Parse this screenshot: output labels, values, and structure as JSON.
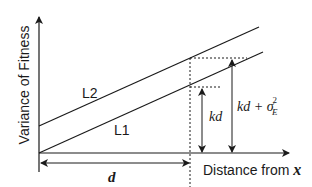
{
  "diagram": {
    "y_axis_label": "Variance of Fitness",
    "x_axis_label_prefix": "Distance from ",
    "x_axis_label_var": "x",
    "line_labels": {
      "upper": "L2",
      "lower": "L1"
    },
    "distance_label": "d",
    "kd_label": "kd",
    "kd_sigma_label": {
      "base": "kd + σ",
      "superscript": "2",
      "subscript": "E"
    },
    "colors": {
      "ink": "#1a1a1a",
      "background": "#ffffff"
    }
  }
}
